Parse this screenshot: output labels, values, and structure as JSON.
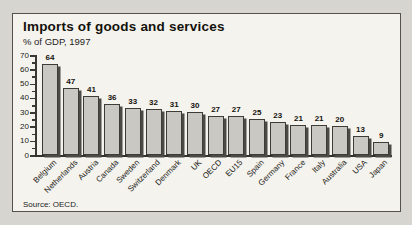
{
  "chart_data": {
    "type": "bar",
    "title": "Imports of goods and services",
    "subtitle": "% of GDP, 1997",
    "source": "Source: OECD.",
    "categories": [
      "Belgium",
      "Netherlands",
      "Austria",
      "Canada",
      "Sweden",
      "Switzerland",
      "Denmark",
      "UK",
      "OECD",
      "EU15",
      "Spain",
      "Germany",
      "France",
      "Italy",
      "Australia",
      "USA",
      "Japan"
    ],
    "values": [
      64,
      47,
      41,
      36,
      33,
      32,
      31,
      30,
      27,
      27,
      25,
      23,
      21,
      21,
      20,
      13,
      9
    ],
    "xlabel": "",
    "ylabel": "",
    "ylim": [
      0,
      70
    ],
    "yticks": [
      0,
      10,
      20,
      30,
      40,
      50,
      60,
      70
    ],
    "ytick_step": 10,
    "yminor_step": 5,
    "grid": false,
    "legend": "none",
    "value_labels": true,
    "colors": {
      "page_background": "#d6d5d0",
      "panel_background": "#f4f3ee",
      "panel_border": "#55524c",
      "bar_fill": "#c9c8c2",
      "bar_border": "#3e3c37",
      "bar_shadow": "#4c4a45",
      "text": "#14120c"
    }
  }
}
